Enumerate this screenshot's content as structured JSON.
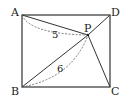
{
  "figure": {
    "type": "geometry",
    "shape": "rectangle",
    "stroke_color": "#333333",
    "dash_color": "#555555",
    "points": {
      "A": {
        "label": "A",
        "x": 22,
        "y": 15
      },
      "D": {
        "label": "D",
        "x": 110,
        "y": 15
      },
      "B": {
        "label": "B",
        "x": 22,
        "y": 87
      },
      "C": {
        "label": "C",
        "x": 110,
        "y": 87
      },
      "P": {
        "label": "P",
        "x": 88,
        "y": 35
      }
    },
    "segments": [
      "AD",
      "DC",
      "CB",
      "BA",
      "AP",
      "BP",
      "CP",
      "DP"
    ],
    "measurements": [
      {
        "segment": "AP",
        "value": "5"
      },
      {
        "segment": "BP",
        "value": "6"
      }
    ]
  }
}
